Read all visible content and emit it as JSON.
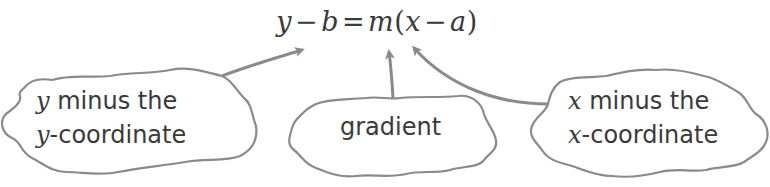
{
  "equation": {
    "y": "y",
    "minus1": "−",
    "b": "b",
    "equals": "=",
    "m": "m",
    "open_paren": "(",
    "x": "x",
    "minus2": "−",
    "a": "a",
    "close_paren": ")"
  },
  "callouts": [
    {
      "id": "left",
      "line1_var": "y",
      "line1_text": " minus the",
      "line2_var": "y",
      "line2_text": "-coordinate",
      "points_to": "y − b"
    },
    {
      "id": "middle",
      "line1_text": "gradient",
      "points_to": "m"
    },
    {
      "id": "right",
      "line1_var": "x",
      "line1_text": " minus the",
      "line2_var": "x",
      "line2_text": "-coordinate",
      "points_to": "x − a"
    }
  ],
  "colors": {
    "text": "#3a3a3a",
    "outline": "#8a8a8a",
    "background": "#ffffff"
  }
}
